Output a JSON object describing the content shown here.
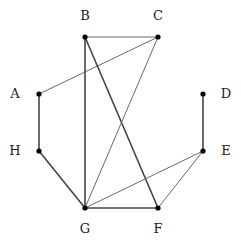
{
  "diagram": {
    "type": "undirected-graph",
    "nodes": [
      {
        "id": "A",
        "label": "A",
        "x": 39,
        "y": 94,
        "label_x": 15,
        "label_y": 98
      },
      {
        "id": "B",
        "label": "B",
        "x": 85,
        "y": 37,
        "label_x": 85,
        "label_y": 20
      },
      {
        "id": "C",
        "label": "C",
        "x": 158,
        "y": 37,
        "label_x": 158,
        "label_y": 20
      },
      {
        "id": "D",
        "label": "D",
        "x": 203,
        "y": 94,
        "label_x": 226,
        "label_y": 98
      },
      {
        "id": "E",
        "label": "E",
        "x": 203,
        "y": 151,
        "label_x": 226,
        "label_y": 155
      },
      {
        "id": "F",
        "label": "F",
        "x": 158,
        "y": 208,
        "label_x": 158,
        "label_y": 233
      },
      {
        "id": "G",
        "label": "G",
        "x": 85,
        "y": 208,
        "label_x": 85,
        "label_y": 233
      },
      {
        "id": "H",
        "label": "H",
        "x": 39,
        "y": 151,
        "label_x": 15,
        "label_y": 155
      }
    ],
    "edges": [
      {
        "from": "A",
        "to": "H",
        "weight": "thick"
      },
      {
        "from": "A",
        "to": "C",
        "weight": "thin"
      },
      {
        "from": "B",
        "to": "C",
        "weight": "thin"
      },
      {
        "from": "B",
        "to": "G",
        "weight": "thick"
      },
      {
        "from": "B",
        "to": "F",
        "weight": "thick"
      },
      {
        "from": "C",
        "to": "G",
        "weight": "thin"
      },
      {
        "from": "D",
        "to": "E",
        "weight": "thick"
      },
      {
        "from": "E",
        "to": "G",
        "weight": "thin"
      },
      {
        "from": "E",
        "to": "F",
        "weight": "thin"
      },
      {
        "from": "G",
        "to": "F",
        "weight": "thick"
      },
      {
        "from": "H",
        "to": "G",
        "weight": "thick"
      }
    ]
  }
}
